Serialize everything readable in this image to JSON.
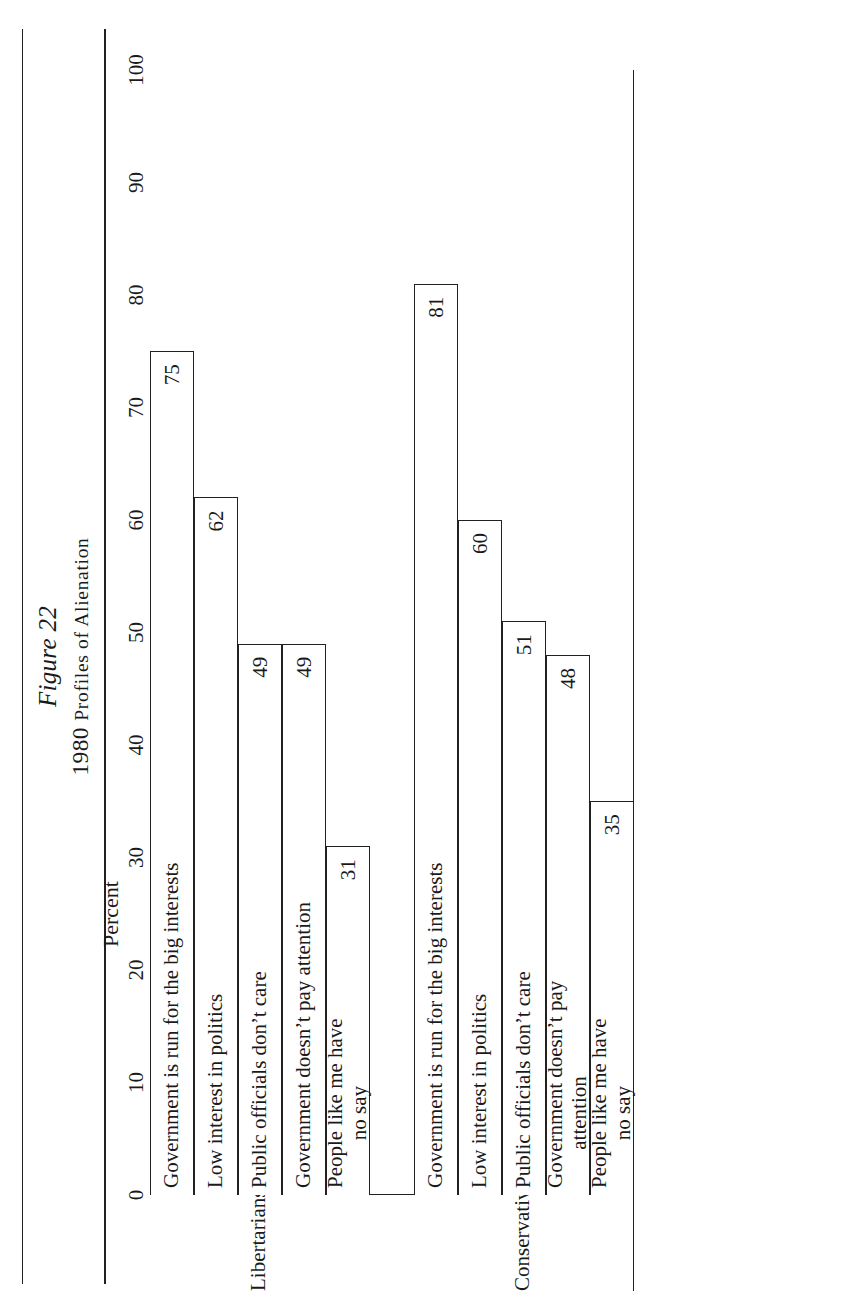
{
  "figure": {
    "number": "Figure 22",
    "title_year": "1980 ",
    "title_caps": "Profiles of Alienation",
    "title_full": "1980 Profiles of Alienation"
  },
  "axis": {
    "label": "Percent",
    "ticks": [
      "0",
      "10",
      "20",
      "30",
      "40",
      "50",
      "60",
      "70",
      "80",
      "90",
      "100"
    ],
    "min": 0,
    "max": 100
  },
  "groups": [
    {
      "name": "Libertarians",
      "bars": [
        {
          "label": "Government is run for the big interests",
          "value": "75"
        },
        {
          "label": "Low interest in politics",
          "value": "62"
        },
        {
          "label": "Public officials don’t care",
          "value": "49"
        },
        {
          "label": "Government doesn’t pay attention",
          "value": "49"
        },
        {
          "label": "People like me have",
          "label2": "no say",
          "value": "31"
        }
      ]
    },
    {
      "name": "Conservatives",
      "bars": [
        {
          "label": "Government is run for the big interests",
          "value": "81"
        },
        {
          "label": "Low interest in politics",
          "value": "60"
        },
        {
          "label": "Public officials don’t care",
          "value": "51"
        },
        {
          "label": "Government doesn’t pay",
          "label2": "attention",
          "value": "48"
        },
        {
          "label": "People like me have",
          "label2": "no say",
          "value": "35"
        }
      ]
    }
  ],
  "chart_data": {
    "type": "bar",
    "orientation": "horizontal",
    "title": "1980 Profiles of Alienation",
    "subtitle": "Figure 22",
    "xlabel": "Percent",
    "ylabel": "",
    "xlim": [
      0,
      100
    ],
    "xticks": [
      0,
      10,
      20,
      30,
      40,
      50,
      60,
      70,
      80,
      90,
      100
    ],
    "grid": false,
    "legend": "none",
    "categories": [
      "Government is run for the big interests",
      "Low interest in politics",
      "Public officials don’t care",
      "Government doesn’t pay attention",
      "People like me have no say"
    ],
    "series": [
      {
        "name": "Libertarians",
        "values": [
          75,
          62,
          49,
          49,
          31
        ]
      },
      {
        "name": "Conservatives",
        "values": [
          81,
          60,
          51,
          48,
          35
        ]
      }
    ],
    "data_labels": [
      "75",
      "62",
      "49",
      "49",
      "31",
      "81",
      "60",
      "51",
      "48",
      "35"
    ]
  }
}
